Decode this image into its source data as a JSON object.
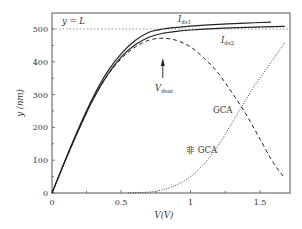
{
  "chart_data": {
    "type": "line",
    "title": "",
    "xlabel": "V(V)",
    "ylabel": "y(nm)",
    "xlim": [
      0,
      1.72
    ],
    "ylim": [
      0,
      550
    ],
    "grid": false,
    "legend": null,
    "x_ticks": [
      "0",
      "0.5",
      "1",
      "1.5"
    ],
    "y_ticks": [
      "0",
      "100",
      "200",
      "300",
      "400",
      "500"
    ],
    "reference_line": {
      "label": "y = L",
      "y": 500,
      "style": "dotted"
    },
    "series": [
      {
        "name": "I_ds1",
        "style": "solid",
        "x": [
          0,
          0.1,
          0.2,
          0.3,
          0.4,
          0.5,
          0.6,
          0.7,
          0.8,
          0.9,
          1.0,
          1.2,
          1.4,
          1.58
        ],
        "y": [
          0,
          105,
          205,
          295,
          370,
          425,
          465,
          490,
          500,
          505,
          509,
          514,
          518,
          521
        ]
      },
      {
        "name": "I_ds2",
        "style": "solid",
        "x": [
          0,
          0.1,
          0.2,
          0.3,
          0.4,
          0.5,
          0.6,
          0.7,
          0.8,
          0.9,
          1.0,
          1.2,
          1.4,
          1.68
        ],
        "y": [
          0,
          103,
          200,
          288,
          360,
          415,
          452,
          475,
          487,
          493,
          497,
          502,
          505,
          508
        ]
      },
      {
        "name": "GCA",
        "style": "dashed",
        "x": [
          0,
          0.1,
          0.2,
          0.3,
          0.4,
          0.5,
          0.6,
          0.7,
          0.8,
          0.9,
          1.0,
          1.1,
          1.2,
          1.3,
          1.4,
          1.5,
          1.6,
          1.68
        ],
        "y": [
          0,
          103,
          200,
          288,
          358,
          410,
          445,
          466,
          472,
          465,
          445,
          410,
          365,
          305,
          240,
          165,
          90,
          45
        ]
      },
      {
        "name": "非 GCA",
        "style": "dotted",
        "x": [
          0.55,
          0.7,
          0.8,
          0.9,
          1.0,
          1.1,
          1.2,
          1.3,
          1.4,
          1.45,
          1.5,
          1.6,
          1.68
        ],
        "y": [
          0,
          3,
          10,
          25,
          50,
          90,
          145,
          215,
          285,
          320,
          350,
          410,
          460
        ]
      }
    ],
    "annotations": [
      {
        "text": "y = L",
        "x": 0.05,
        "y": 520
      },
      {
        "text": "I_ds1",
        "x": 0.93,
        "y": 540
      },
      {
        "text": "I_ds2",
        "x": 1.22,
        "y": 468
      },
      {
        "text": "V_dsat",
        "x": 0.8,
        "y": 355,
        "arrow_to": [
          0.8,
          452
        ]
      },
      {
        "text": "GCA",
        "x": 1.13,
        "y": 300
      },
      {
        "text": "非 GCA",
        "x": 0.98,
        "y": 105
      }
    ]
  },
  "labels": {
    "x_axis": "V(V)",
    "y_axis": "y (nm)",
    "ref_line": "y = L",
    "ids1_main": "I",
    "ids1_sub": "ds1",
    "ids2_main": "I",
    "ids2_sub": "ds2",
    "vdsat_main": "V",
    "vdsat_sub": "dsat",
    "gca": "GCA",
    "non_gca": "非 GCA"
  },
  "ticks": {
    "x": [
      "0",
      "0.5",
      "1",
      "1.5"
    ],
    "y": [
      "0",
      "100",
      "200",
      "300",
      "400",
      "500"
    ]
  },
  "colors": {
    "line": "#222222",
    "axis": "#444444",
    "ref": "#777777"
  }
}
